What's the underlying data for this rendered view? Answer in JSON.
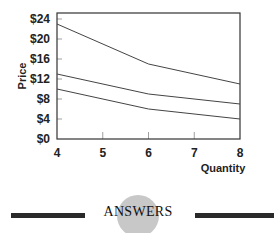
{
  "chart_data": {
    "type": "line",
    "title": "",
    "xlabel": "Quantity",
    "ylabel": "Price",
    "x": [
      4,
      6,
      8
    ],
    "series": [
      {
        "name": "Line 1",
        "values": [
          23,
          15,
          11
        ]
      },
      {
        "name": "Line 2",
        "values": [
          13,
          9,
          7
        ]
      },
      {
        "name": "Line 3",
        "values": [
          10,
          6,
          4
        ]
      }
    ],
    "xticks": [
      "4",
      "5",
      "6",
      "7",
      "8"
    ],
    "yticks": [
      "$0",
      "$4",
      "$8",
      "$12",
      "$16",
      "$20",
      "$24"
    ],
    "xlim": [
      4,
      8
    ],
    "ylim": [
      0,
      25
    ],
    "grid": false,
    "legend": "none"
  },
  "footer": {
    "label": "ANSWERS"
  }
}
